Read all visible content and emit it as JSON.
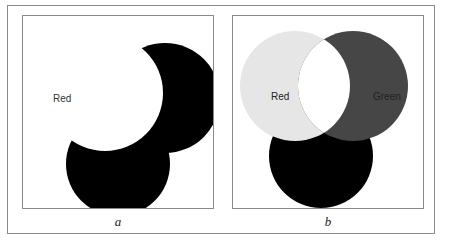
{
  "figure": {
    "panels": [
      {
        "id": "a",
        "caption": "a",
        "labels": {
          "red": "Red"
        },
        "colors": {
          "red": "#ffffff",
          "green": "#000000",
          "blue": "#000000",
          "background": "#ffffff",
          "label": "#333333"
        }
      },
      {
        "id": "b",
        "caption": "b",
        "labels": {
          "red": "Red",
          "green": "Green"
        },
        "colors": {
          "red": "#e6e6e6",
          "green": "#464646",
          "blue": "#000000",
          "overlap_red_green": "#ffffff",
          "background": "#ffffff",
          "label": "#222222"
        }
      }
    ]
  }
}
